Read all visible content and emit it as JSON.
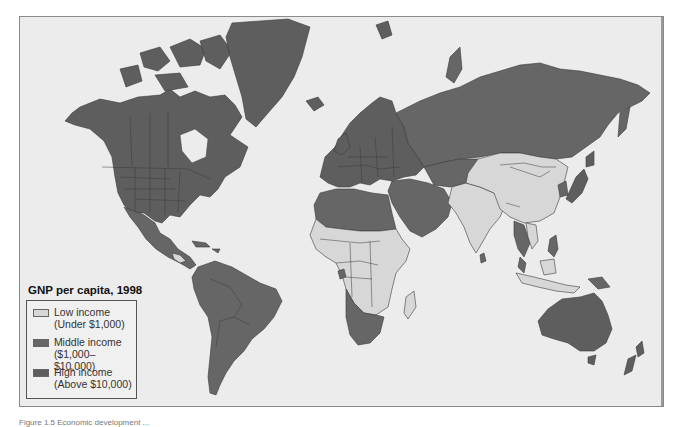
{
  "map": {
    "title": "GNP per capita, 1998",
    "colors": {
      "ocean": "#ececec",
      "low": "#d7d7d7",
      "middle": "#666666",
      "high": "#5e5e5e",
      "border": "#3a3a3a"
    },
    "legend": {
      "title": "GNP per capita, 1998",
      "items": [
        {
          "key": "low",
          "label": "Low income",
          "range": "(Under $1,000)",
          "color": "#d7d7d7"
        },
        {
          "key": "middle",
          "label": "Middle income",
          "range": "($1,000–$10,000)",
          "color": "#666666"
        },
        {
          "key": "high",
          "label": "High income",
          "range": "(Above $10,000)",
          "color": "#5e5e5e"
        }
      ]
    },
    "regions": {
      "low_income": [
        "China",
        "India",
        "Sub-Saharan Africa (most)",
        "Madagascar",
        "Central Asia (parts)",
        "Indochina",
        "Indonesia",
        "Papua New Guinea",
        "Nicaragua",
        "Honduras"
      ],
      "middle_income": [
        "Russia",
        "Latin America",
        "North Africa",
        "Middle East",
        "Eastern Europe",
        "South Africa",
        "Namibia",
        "Botswana",
        "Mexico",
        "Thailand",
        "Philippines",
        "Malaysia"
      ],
      "high_income": [
        "United States",
        "Canada",
        "Western Europe",
        "Japan",
        "Australia",
        "New Zealand",
        "Greenland",
        "Scandinavia",
        "Saudi Arabia"
      ]
    }
  },
  "caption": "Figure 1.5  Economic development ..."
}
